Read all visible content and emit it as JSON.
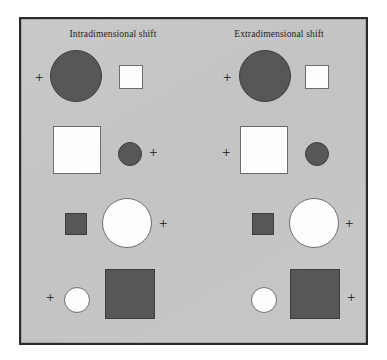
{
  "figure": {
    "caption_titles": {
      "left": "Intradimensional shift",
      "right": "Extradimensional shift"
    },
    "marker_glyph": "+",
    "colors": {
      "panel_background": "#c5c5c5",
      "panel_border": "#2b2b2b",
      "shape_dark_fill": "#575757",
      "shape_dark_stroke": "#3d3d3d",
      "shape_white_fill": "#fdfdfd",
      "shape_white_stroke": "#6e6e6e",
      "text": "#1d1d1d",
      "page_background": "#ffffff"
    }
  },
  "chart_data": {
    "type": "table",
    "columns": [
      "Intradimensional shift",
      "Extradimensional shift"
    ],
    "rows": [
      {
        "row": 1,
        "left": {
          "items": [
            {
              "kind": "marker",
              "label": "+",
              "x": 33,
              "y": 68,
              "side": "left-of-pair"
            },
            {
              "kind": "circle",
              "fill": "dark",
              "size": "large",
              "x": 48,
              "y": 48,
              "w": 52,
              "h": 52
            },
            {
              "kind": "square",
              "fill": "white",
              "size": "small",
              "x": 117,
              "y": 63,
              "w": 24,
              "h": 24
            }
          ],
          "marked_position": "far-left"
        },
        "right": {
          "items": [
            {
              "kind": "marker",
              "label": "+",
              "x": 221,
              "y": 68,
              "side": "left-of-pair"
            },
            {
              "kind": "circle",
              "fill": "dark",
              "size": "large",
              "x": 237,
              "y": 48,
              "w": 52,
              "h": 52
            },
            {
              "kind": "square",
              "fill": "white",
              "size": "small",
              "x": 303,
              "y": 63,
              "w": 24,
              "h": 24
            }
          ],
          "marked_position": "far-left"
        }
      },
      {
        "row": 2,
        "left": {
          "items": [
            {
              "kind": "square",
              "fill": "white",
              "size": "large",
              "x": 51,
              "y": 124,
              "w": 48,
              "h": 48
            },
            {
              "kind": "circle",
              "fill": "dark",
              "size": "small",
              "x": 116,
              "y": 140,
              "w": 24,
              "h": 24
            },
            {
              "kind": "marker",
              "label": "+",
              "x": 147,
              "y": 143,
              "side": "right-of-pair"
            }
          ],
          "marked_position": "far-right"
        },
        "right": {
          "items": [
            {
              "kind": "marker",
              "label": "+",
              "x": 220,
              "y": 143,
              "side": "left-of-pair"
            },
            {
              "kind": "square",
              "fill": "white",
              "size": "large",
              "x": 238,
              "y": 124,
              "w": 48,
              "h": 48
            },
            {
              "kind": "circle",
              "fill": "dark",
              "size": "small",
              "x": 303,
              "y": 140,
              "w": 24,
              "h": 24
            }
          ],
          "marked_position": "far-left"
        }
      },
      {
        "row": 3,
        "left": {
          "items": [
            {
              "kind": "square",
              "fill": "dark",
              "size": "small",
              "x": 63,
              "y": 211,
              "w": 22,
              "h": 22
            },
            {
              "kind": "circle",
              "fill": "white",
              "size": "large",
              "x": 100,
              "y": 196,
              "w": 50,
              "h": 50
            },
            {
              "kind": "marker",
              "label": "+",
              "x": 157,
              "y": 214,
              "side": "right-of-pair"
            }
          ],
          "marked_position": "far-right"
        },
        "right": {
          "items": [
            {
              "kind": "square",
              "fill": "dark",
              "size": "small",
              "x": 250,
              "y": 211,
              "w": 22,
              "h": 22
            },
            {
              "kind": "circle",
              "fill": "white",
              "size": "large",
              "x": 287,
              "y": 196,
              "w": 50,
              "h": 50
            },
            {
              "kind": "marker",
              "label": "+",
              "x": 343,
              "y": 214,
              "side": "right-of-pair"
            }
          ],
          "marked_position": "far-right"
        }
      },
      {
        "row": 4,
        "left": {
          "items": [
            {
              "kind": "marker",
              "label": "+",
              "x": 44,
              "y": 288,
              "side": "left-of-pair"
            },
            {
              "kind": "circle",
              "fill": "white",
              "size": "small",
              "x": 62,
              "y": 285,
              "w": 26,
              "h": 26
            },
            {
              "kind": "square",
              "fill": "dark",
              "size": "large",
              "x": 103,
              "y": 267,
              "w": 50,
              "h": 50
            }
          ],
          "marked_position": "far-left"
        },
        "right": {
          "items": [
            {
              "kind": "circle",
              "fill": "white",
              "size": "small",
              "x": 249,
              "y": 285,
              "w": 26,
              "h": 26
            },
            {
              "kind": "square",
              "fill": "dark",
              "size": "large",
              "x": 288,
              "y": 267,
              "w": 50,
              "h": 50
            },
            {
              "kind": "marker",
              "label": "+",
              "x": 345,
              "y": 288,
              "side": "right-of-pair"
            }
          ],
          "marked_position": "far-right"
        }
      }
    ],
    "legend": []
  }
}
